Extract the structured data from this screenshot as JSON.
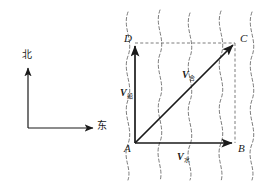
{
  "figure": {
    "background_color": "#ffffff",
    "stroke_color": "#1a1a1a",
    "dashed_color": "#555555"
  },
  "compass": {
    "north_label": "北",
    "east_label": "东",
    "north_arrow_name": "north-arrow",
    "east_arrow_name": "east-arrow"
  },
  "diagram": {
    "points": [
      {
        "id": "A",
        "label": "A",
        "x": 135,
        "y": 143
      },
      {
        "id": "B",
        "label": "B",
        "x": 235,
        "y": 143
      },
      {
        "id": "C",
        "label": "C",
        "x": 235,
        "y": 43
      },
      {
        "id": "D",
        "label": "D",
        "x": 135,
        "y": 43
      }
    ],
    "vectors": [
      {
        "id": "v-boat",
        "base": "V",
        "subscript": "船",
        "from": "A",
        "to": "D",
        "label_x": 120,
        "label_y": 88
      },
      {
        "id": "v-resultant",
        "base": "V",
        "subscript": "合",
        "from": "A",
        "to": "C",
        "label_x": 182,
        "label_y": 70
      },
      {
        "id": "v-water",
        "base": "V",
        "subscript": "水",
        "from": "A",
        "to": "B",
        "label_x": 177,
        "label_y": 152
      }
    ],
    "dashed_edges": [
      {
        "id": "edge-DC",
        "from": "D",
        "to": "C"
      },
      {
        "id": "edge-BC",
        "from": "B",
        "to": "C"
      }
    ],
    "current_lines_count": 5,
    "current_lines_note": "wavy vertical dashed lines representing river flow"
  }
}
